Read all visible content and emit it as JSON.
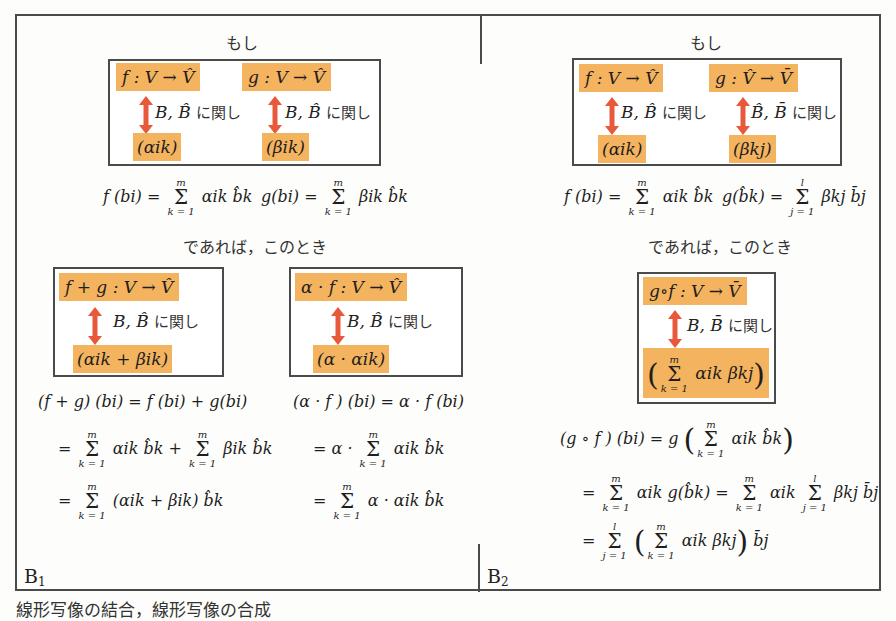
{
  "figure": {
    "caption": "線形写像の結合，線形写像の合成",
    "colors": {
      "highlight": "#f4b35e",
      "arrow": "#e8583a",
      "border": "#4a4a4a",
      "text": "#1e1e1e"
    }
  },
  "panel_b1": {
    "label": "B",
    "label_sub": "1",
    "if_label": "もし",
    "then_label": "であれば，このとき",
    "premise": {
      "left": {
        "map": "f : V → V̂",
        "relation_basis": "B, B̂",
        "relation_text": "に関し",
        "matrix": "(αik)"
      },
      "right": {
        "map": "g : V → V̂",
        "relation_basis": "B, B̂",
        "relation_text": "に関し",
        "matrix": "(βik)"
      }
    },
    "definitions": {
      "f_lhs": "f (bi) =",
      "f_rhs": "αik b̂k",
      "g_lhs": "g(bi) =",
      "g_rhs": "βik b̂k",
      "sum_top": "m",
      "sum_bottom": "k = 1"
    },
    "sum_box": {
      "map": "f + g : V → V̂",
      "relation_basis": "B, B̂",
      "relation_text": "に関し",
      "matrix": "(αik + βik)"
    },
    "scalar_box": {
      "map": "α · f : V → V̂",
      "relation_basis": "B, B̂",
      "relation_text": "に関し",
      "matrix": "(α · αik)"
    },
    "sum_derivation": [
      "(f + g) (bi) = f (bi) + g(bi)",
      "= Σ αik b̂k + Σ βik b̂k",
      "= Σ (αik + βik) b̂k"
    ],
    "scalar_derivation": [
      "(α · f ) (bi) = α · f (bi)",
      "= α · Σ αik b̂k",
      "= Σ α · αik b̂k"
    ]
  },
  "panel_b2": {
    "label": "B",
    "label_sub": "2",
    "if_label": "もし",
    "then_label": "であれば，このとき",
    "premise": {
      "left": {
        "map": "f : V → V̂",
        "relation_basis": "B, B̂",
        "relation_text": "に関し",
        "matrix": "(αik)"
      },
      "right": {
        "map": "g : V̂ → V̄",
        "relation_basis": "B̂, B̄",
        "relation_text": "に関し",
        "matrix": "(βkj)"
      }
    },
    "definitions": {
      "f_lhs": "f (bi) =",
      "f_rhs": "αik b̂k",
      "f_sum_top": "m",
      "f_sum_bottom": "k = 1",
      "g_lhs": "g(b̂k) =",
      "g_rhs": "βkj b̄j",
      "g_sum_top": "l",
      "g_sum_bottom": "j = 1"
    },
    "composition_box": {
      "map": "g∘f : V → V̄",
      "relation_basis": "B, B̄",
      "relation_text": "に関し",
      "matrix": "( Σ αik βkj )",
      "sum_top": "m",
      "sum_bottom": "k = 1"
    },
    "derivation": [
      "(g ∘ f ) (bi) = g ( Σ αik b̂k )",
      "= Σ αik g(b̂k) = Σ αik Σ βkj b̄j",
      "= Σ ( Σ αik βkj ) b̄j"
    ]
  }
}
